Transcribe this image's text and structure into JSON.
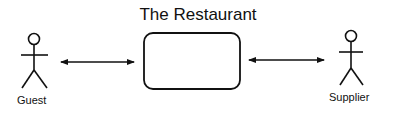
{
  "diagram": {
    "title": "The Restaurant",
    "actors": [
      {
        "label": "Guest"
      },
      {
        "label": "Supplier"
      }
    ],
    "system": {
      "label": ""
    },
    "colors": {
      "stroke": "#111111",
      "background": "#ffffff"
    }
  }
}
